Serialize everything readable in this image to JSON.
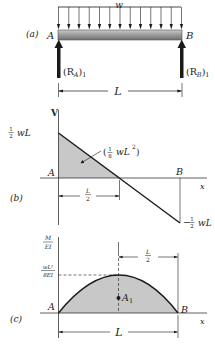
{
  "panels": {
    "a": {
      "label": "(a)",
      "load_label": "w",
      "left_label": "A",
      "right_label": "B",
      "reaction_a_main": "(R",
      "reaction_a_sub": "A",
      "reaction_a_tail": ")",
      "reaction_a_index": "1",
      "reaction_b_main": "(R",
      "reaction_b_sub": "B",
      "reaction_b_tail": ")",
      "reaction_b_index": "1",
      "span_label": "L",
      "load_arrow_count": 13
    },
    "b": {
      "label": "(b)",
      "y_axis": "V",
      "x_axis": "x",
      "top_value_frac": "1/2",
      "top_value": "wL",
      "bottom_value_sign": "−",
      "bottom_value_frac": "1/2",
      "bottom_value": "wL",
      "area_open": "(",
      "area_frac": "1/8",
      "area_value": "wL",
      "area_exp": "2",
      "area_close": ")",
      "left_label": "A",
      "right_label": "B",
      "half_span_label": "L/2"
    },
    "c": {
      "label": "(c)",
      "y_axis_num": "M",
      "y_axis_den": "EI",
      "peak_num": "wL²",
      "peak_den": "8EI",
      "x_axis": "x",
      "left_label": "A",
      "right_label": "B",
      "centroid_label": "A",
      "centroid_sub": "1",
      "half_span_label": "L/2",
      "span_label": "L"
    }
  },
  "colors": {
    "ink": "#1a1a1a",
    "shade": "#c8c8c8",
    "beam_light": "#b5b5b5",
    "beam_dark": "#7a7a7a"
  }
}
